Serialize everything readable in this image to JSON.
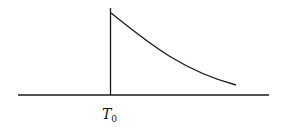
{
  "diagram": {
    "time_label": {
      "main": "T",
      "subscript": "0"
    },
    "colors": {
      "line": "#1a1a1a",
      "background": "#ffffff"
    }
  }
}
